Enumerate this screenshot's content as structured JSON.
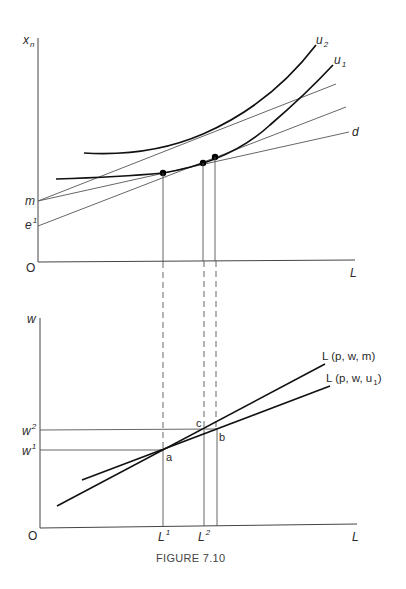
{
  "figure": {
    "caption": "FIGURE 7.10",
    "upper_panel": {
      "y_axis_label": "x",
      "y_axis_label_sub": "n",
      "x_axis_label": "L",
      "origin_label": "O",
      "intercepts": [
        {
          "id": "m",
          "label": "m"
        },
        {
          "id": "e1",
          "label": "e",
          "sup": "1"
        }
      ],
      "curves": [
        {
          "id": "u2",
          "label": "u",
          "sub": "2"
        },
        {
          "id": "u1",
          "label": "u",
          "sub": "1"
        }
      ],
      "lines": [
        {
          "id": "d",
          "label": "d"
        }
      ]
    },
    "lower_panel": {
      "y_axis_label": "w",
      "x_axis_label": "L",
      "origin_label": "O",
      "wage_levels": [
        {
          "id": "w2",
          "label": "w",
          "sup": "2"
        },
        {
          "id": "w1",
          "label": "w",
          "sup": "1"
        }
      ],
      "labor_levels": [
        {
          "id": "L1",
          "label": "L",
          "sup": "1"
        },
        {
          "id": "L2",
          "label": "L",
          "sup": "2"
        }
      ],
      "points": [
        {
          "id": "a",
          "label": "a"
        },
        {
          "id": "b",
          "label": "b"
        },
        {
          "id": "c",
          "label": "c"
        }
      ],
      "supply_curves": [
        {
          "id": "Lm",
          "label": "L (p, w, m)"
        },
        {
          "id": "Lu1",
          "label_prefix": "L (p, w, u",
          "sub": "1",
          "label_suffix": ")"
        }
      ]
    }
  }
}
